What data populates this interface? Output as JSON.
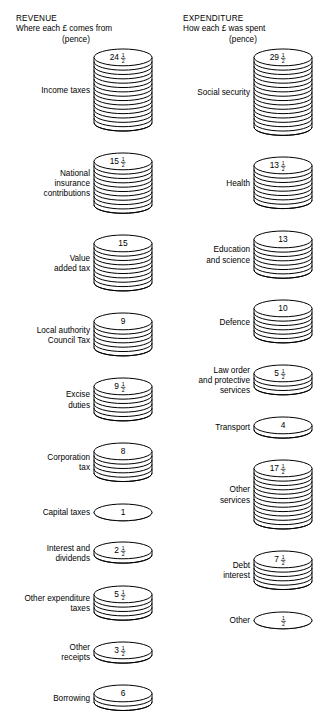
{
  "figure": {
    "type": "pictogram-chart",
    "units": "pence",
    "background_color": "#ffffff",
    "ink_color": "#000000"
  },
  "revenue": {
    "title": "REVENUE",
    "subtitle": "Where each £ comes from",
    "unit": "(pence)",
    "items": [
      {
        "label": "Income taxes",
        "value": 24.5,
        "display": "24",
        "frac_num": "1",
        "frac_den": "2",
        "coins": 16
      },
      {
        "label": "National\ninsurance\ncontributions",
        "value": 15.5,
        "display": "15",
        "frac_num": "1",
        "frac_den": "2",
        "coins": 11
      },
      {
        "label": "Value\nadded tax",
        "value": 15,
        "display": "15",
        "frac_num": "",
        "frac_den": "",
        "coins": 10
      },
      {
        "label": "Local authority\nCouncil Tax",
        "value": 9,
        "display": "9",
        "frac_num": "",
        "frac_den": "",
        "coins": 7
      },
      {
        "label": "Excise\nduties",
        "value": 9.5,
        "display": "9",
        "frac_num": "1",
        "frac_den": "2",
        "coins": 7
      },
      {
        "label": "Corporation\ntax",
        "value": 8,
        "display": "8",
        "frac_num": "",
        "frac_den": "",
        "coins": 6
      },
      {
        "label": "Capital taxes",
        "value": 1,
        "display": "1",
        "frac_num": "",
        "frac_den": "",
        "coins": 1
      },
      {
        "label": "Interest and\ndividends",
        "value": 2.5,
        "display": "2",
        "frac_num": "1",
        "frac_den": "2",
        "coins": 2
      },
      {
        "label": "Other expenditure\ntaxes",
        "value": 5.5,
        "display": "5",
        "frac_num": "1",
        "frac_den": "2",
        "coins": 5
      },
      {
        "label": "Other\nreceipts",
        "value": 3.5,
        "display": "3",
        "frac_num": "1",
        "frac_den": "2",
        "coins": 2
      },
      {
        "label": "Borrowing",
        "value": 6,
        "display": "6",
        "frac_num": "",
        "frac_den": "",
        "coins": 3
      }
    ]
  },
  "expenditure": {
    "title": "EXPENDITURE",
    "subtitle": "How each £ was spent",
    "unit": "(pence)",
    "items": [
      {
        "label": "Social security",
        "value": 29.5,
        "display": "29",
        "frac_num": "1",
        "frac_den": "2",
        "coins": 17
      },
      {
        "label": "Health",
        "value": 13.5,
        "display": "13",
        "frac_num": "1",
        "frac_den": "2",
        "coins": 9
      },
      {
        "label": "Education\nand science",
        "value": 13,
        "display": "13",
        "frac_num": "",
        "frac_den": "",
        "coins": 8
      },
      {
        "label": "Defence",
        "value": 10,
        "display": "10",
        "frac_num": "",
        "frac_den": "",
        "coins": 7
      },
      {
        "label": "Law order\nand protective\nservices",
        "value": 5.5,
        "display": "5",
        "frac_num": "1",
        "frac_den": "2",
        "coins": 4
      },
      {
        "label": "Transport",
        "value": 4,
        "display": "4",
        "frac_num": "",
        "frac_den": "",
        "coins": 2
      },
      {
        "label": "Other\nservices",
        "value": 17.5,
        "display": "17",
        "frac_num": "1",
        "frac_den": "2",
        "coins": 13
      },
      {
        "label": "Debt\ninterest",
        "value": 7.5,
        "display": "7",
        "frac_num": "1",
        "frac_den": "2",
        "coins": 6
      },
      {
        "label": "Other",
        "value": 0.5,
        "display": "",
        "frac_num": "1",
        "frac_den": "2",
        "coins": 1
      }
    ]
  },
  "chart_data": {
    "type": "bar",
    "subtitle": "Government revenue and expenditure, pence in the pound",
    "xlabel": "",
    "ylabel": "pence",
    "ylim": [
      0,
      30
    ],
    "grid": false,
    "legend": "none",
    "series": [
      {
        "name": "REVENUE",
        "axis_note": "Where each £ comes from (pence)",
        "total": 100,
        "categories": [
          "Income taxes",
          "National insurance contributions",
          "Value added tax",
          "Local authority Council Tax",
          "Excise duties",
          "Corporation tax",
          "Capital taxes",
          "Interest and dividends",
          "Other expenditure taxes",
          "Other receipts",
          "Borrowing"
        ],
        "values": [
          24.5,
          15.5,
          15,
          9,
          9.5,
          8,
          1,
          2.5,
          5.5,
          3.5,
          6
        ],
        "value_labels": [
          "24 1/2",
          "15 1/2",
          "15",
          "9",
          "9 1/2",
          "8",
          "1",
          "2 1/2",
          "5 1/2",
          "3 1/2",
          "6"
        ]
      },
      {
        "name": "EXPENDITURE",
        "axis_note": "How each £ was spent (pence)",
        "total": 100,
        "categories": [
          "Social security",
          "Health",
          "Education and science",
          "Defence",
          "Law order and protective services",
          "Transport",
          "Other services",
          "Debt interest",
          "Other"
        ],
        "values": [
          29.5,
          13.5,
          13,
          10,
          5.5,
          4,
          17.5,
          7.5,
          0.5
        ],
        "value_labels": [
          "29 1/2",
          "13 1/2",
          "13",
          "10",
          "5 1/2",
          "4",
          "17 1/2",
          "7 1/2",
          "1/2"
        ]
      }
    ]
  }
}
